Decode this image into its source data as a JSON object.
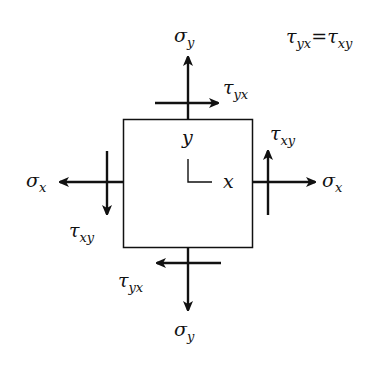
{
  "diagram": {
    "equation": {
      "lhs": "τ",
      "lhs_sub": "yx",
      "eq": "=",
      "rhs": "τ",
      "rhs_sub": "xy"
    },
    "labels": {
      "sigma_y_top": {
        "sym": "σ",
        "sub": "y"
      },
      "tau_yx_top": {
        "sym": "τ",
        "sub": "yx"
      },
      "tau_xy_right": {
        "sym": "τ",
        "sub": "xy"
      },
      "sigma_x_right": {
        "sym": "σ",
        "sub": "x"
      },
      "sigma_x_left": {
        "sym": "σ",
        "sub": "x"
      },
      "tau_xy_left": {
        "sym": "τ",
        "sub": "xy"
      },
      "tau_yx_bottom": {
        "sym": "τ",
        "sub": "yx"
      },
      "sigma_y_bottom": {
        "sym": "σ",
        "sub": "y"
      },
      "axis_y": "y",
      "axis_x": "x"
    },
    "colors": {
      "stroke": "#111111",
      "background": "#ffffff"
    }
  }
}
